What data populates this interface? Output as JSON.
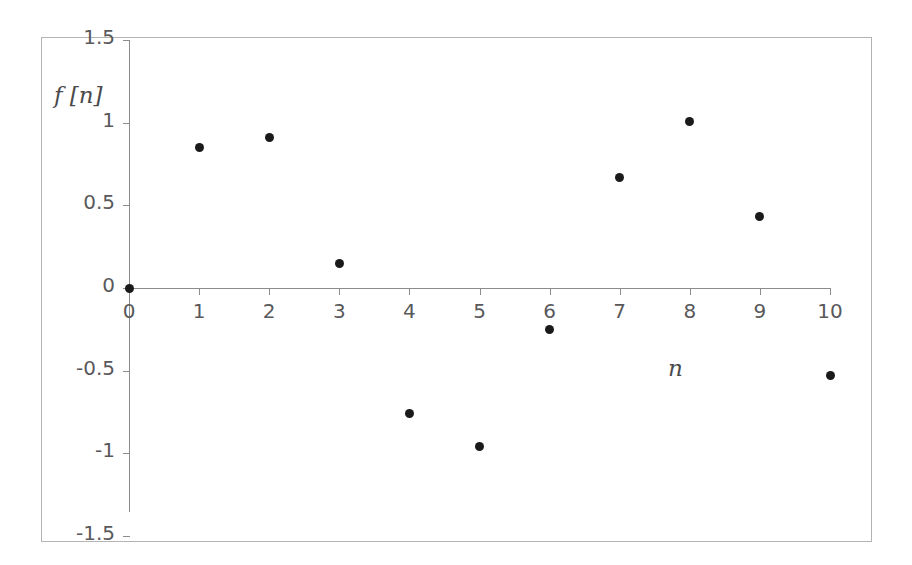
{
  "chart_data": {
    "type": "scatter",
    "title": "",
    "xlabel": "n",
    "ylabel": "f [n]",
    "x": [
      0,
      1,
      2,
      3,
      4,
      5,
      6,
      7,
      8,
      9,
      10
    ],
    "values": [
      0,
      0.85,
      0.91,
      0.15,
      -0.76,
      -0.96,
      -0.25,
      0.67,
      1.01,
      0.43,
      -0.53
    ],
    "series": [
      {
        "name": "f[n]",
        "values": [
          0,
          0.85,
          0.91,
          0.15,
          -0.76,
          -0.96,
          -0.25,
          0.67,
          1.01,
          0.43,
          -0.53
        ]
      }
    ],
    "xlim": [
      0,
      10
    ],
    "ylim": [
      -1.5,
      1.5
    ],
    "x_tick_labels": [
      "0",
      "1",
      "2",
      "3",
      "4",
      "5",
      "6",
      "7",
      "8",
      "9",
      "10"
    ],
    "y_tick_labels": [
      "1.5",
      "1",
      "0.5",
      "0",
      "-0.5",
      "-1",
      "-1.5"
    ],
    "y_tick_values": [
      1.5,
      1,
      0.5,
      0,
      -0.5,
      -1,
      -1.5
    ],
    "grid": false,
    "legend": false,
    "marker": "filled-circle",
    "marker_color": "#1a1a1a",
    "axis_color": "#8c8c8c",
    "frame_color": "#b4b4b4",
    "tick_label_color": "#59595b"
  },
  "axis_labels": {
    "y": "f [n]",
    "x": "n"
  }
}
